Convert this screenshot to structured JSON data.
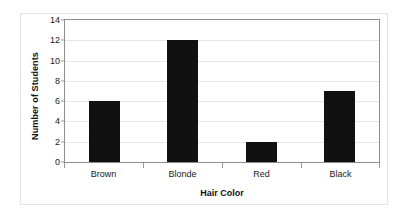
{
  "chart_data": {
    "type": "bar",
    "title": "",
    "categories": [
      "Brown",
      "Blonde",
      "Red",
      "Black"
    ],
    "values": [
      6,
      12,
      2,
      7
    ],
    "xlabel": "Hair Color",
    "ylabel": "Number of Students",
    "ylim": [
      0,
      14
    ],
    "ytick_labels": [
      "0",
      "2",
      "4",
      "6",
      "8",
      "10",
      "12",
      "14"
    ],
    "ytick_values": [
      0,
      2,
      4,
      6,
      8,
      10,
      12,
      14
    ],
    "grid": "horizontal",
    "legend": "none",
    "bar_color": "#111111",
    "plot_border_color": "#8c8c8c",
    "gridline_color": "#e6e6e6",
    "frame_color": "#e3e3e3",
    "background_color": "#ffffff"
  }
}
